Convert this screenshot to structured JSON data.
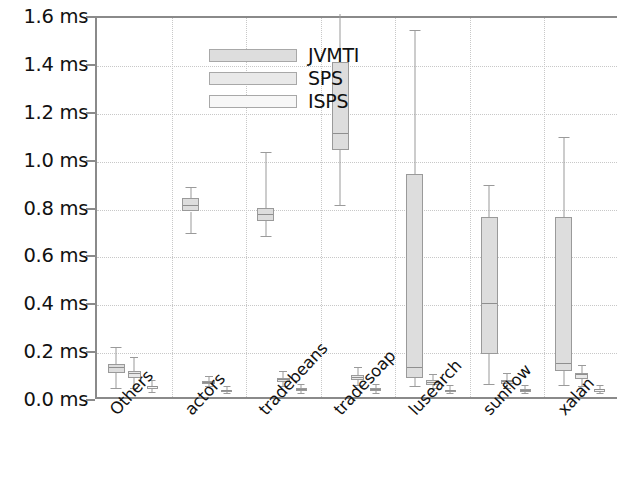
{
  "chart_data": {
    "type": "boxplot",
    "title": "",
    "xlabel": "",
    "ylabel": "",
    "ylim": [
      0.0,
      1.6
    ],
    "y_unit": "ms",
    "grid": true,
    "legend_position": "top-left",
    "y_ticks": [
      {
        "value": 0.0,
        "label": "0.0 ms"
      },
      {
        "value": 0.2,
        "label": "0.2 ms"
      },
      {
        "value": 0.4,
        "label": "0.4 ms"
      },
      {
        "value": 0.6,
        "label": "0.6 ms"
      },
      {
        "value": 0.8,
        "label": "0.8 ms"
      },
      {
        "value": 1.0,
        "label": "1.0 ms"
      },
      {
        "value": 1.2,
        "label": "1.2 ms"
      },
      {
        "value": 1.4,
        "label": "1.4 ms"
      },
      {
        "value": 1.6,
        "label": "1.6 ms"
      }
    ],
    "categories": [
      "Others",
      "actors",
      "tradebeans",
      "tradesoap",
      "lusearch",
      "sunflow",
      "xalan"
    ],
    "series": [
      {
        "name": "JVMTI",
        "color": "#dddddd",
        "boxes": [
          {
            "category": "Others",
            "whisker_low": 0.035,
            "q1": 0.1,
            "median": 0.12,
            "q3": 0.14,
            "whisker_high": 0.205
          },
          {
            "category": "actors",
            "whisker_low": 0.68,
            "q1": 0.775,
            "median": 0.8,
            "q3": 0.83,
            "whisker_high": 0.875
          },
          {
            "category": "tradebeans",
            "whisker_low": 0.67,
            "q1": 0.735,
            "median": 0.76,
            "q3": 0.79,
            "whisker_high": 1.02
          },
          {
            "category": "tradesoap",
            "whisker_low": 0.8,
            "q1": 1.03,
            "median": 1.1,
            "q3": 1.4,
            "whisker_high": 1.66
          },
          {
            "category": "lusearch",
            "whisker_low": 0.04,
            "q1": 0.08,
            "median": 0.12,
            "q3": 0.93,
            "whisker_high": 1.53
          },
          {
            "category": "sunflow",
            "whisker_low": 0.05,
            "q1": 0.18,
            "median": 0.39,
            "q3": 0.75,
            "whisker_high": 0.88
          },
          {
            "category": "xalan",
            "whisker_low": 0.045,
            "q1": 0.11,
            "median": 0.14,
            "q3": 0.75,
            "whisker_high": 1.08
          }
        ]
      },
      {
        "name": "SPS",
        "color": "#e9e9e9",
        "boxes": [
          {
            "category": "Others",
            "whisker_low": 0.035,
            "q1": 0.08,
            "median": 0.095,
            "q3": 0.11,
            "whisker_high": 0.165
          },
          {
            "category": "actors",
            "whisker_low": 0.04,
            "q1": 0.055,
            "median": 0.06,
            "q3": 0.068,
            "whisker_high": 0.085
          },
          {
            "category": "tradebeans",
            "whisker_low": 0.04,
            "q1": 0.062,
            "median": 0.07,
            "q3": 0.08,
            "whisker_high": 0.105
          },
          {
            "category": "tradesoap",
            "whisker_low": 0.045,
            "q1": 0.07,
            "median": 0.08,
            "q3": 0.092,
            "whisker_high": 0.12
          },
          {
            "category": "lusearch",
            "whisker_low": 0.035,
            "q1": 0.052,
            "median": 0.06,
            "q3": 0.07,
            "whisker_high": 0.09
          },
          {
            "category": "sunflow",
            "whisker_low": 0.035,
            "q1": 0.055,
            "median": 0.062,
            "q3": 0.072,
            "whisker_high": 0.095
          },
          {
            "category": "xalan",
            "whisker_low": 0.04,
            "q1": 0.075,
            "median": 0.09,
            "q3": 0.102,
            "whisker_high": 0.13
          }
        ]
      },
      {
        "name": "ISPS",
        "color": "#f7f7f7",
        "boxes": [
          {
            "category": "Others",
            "whisker_low": 0.018,
            "q1": 0.032,
            "median": 0.04,
            "q3": 0.048,
            "whisker_high": 0.068
          },
          {
            "category": "actors",
            "whisker_low": 0.012,
            "q1": 0.02,
            "median": 0.024,
            "q3": 0.03,
            "whisker_high": 0.042
          },
          {
            "category": "tradebeans",
            "whisker_low": 0.014,
            "q1": 0.024,
            "median": 0.03,
            "q3": 0.036,
            "whisker_high": 0.05
          },
          {
            "category": "tradesoap",
            "whisker_low": 0.014,
            "q1": 0.024,
            "median": 0.03,
            "q3": 0.038,
            "whisker_high": 0.052
          },
          {
            "category": "lusearch",
            "whisker_low": 0.012,
            "q1": 0.02,
            "median": 0.025,
            "q3": 0.031,
            "whisker_high": 0.044
          },
          {
            "category": "sunflow",
            "whisker_low": 0.012,
            "q1": 0.022,
            "median": 0.027,
            "q3": 0.033,
            "whisker_high": 0.046
          },
          {
            "category": "xalan",
            "whisker_low": 0.013,
            "q1": 0.022,
            "median": 0.028,
            "q3": 0.034,
            "whisker_high": 0.048
          }
        ]
      }
    ]
  },
  "legend": {
    "entries": [
      {
        "label": "JVMTI",
        "swatch": "#dddddd"
      },
      {
        "label": "SPS",
        "swatch": "#e9e9e9"
      },
      {
        "label": "ISPS",
        "swatch": "#f7f7f7"
      }
    ]
  },
  "colors": {
    "axis": "#8a8a8a",
    "grid": "#c8c8c8",
    "box_outline": "#9a9a9a",
    "text": "#111111",
    "background": "#ffffff"
  }
}
